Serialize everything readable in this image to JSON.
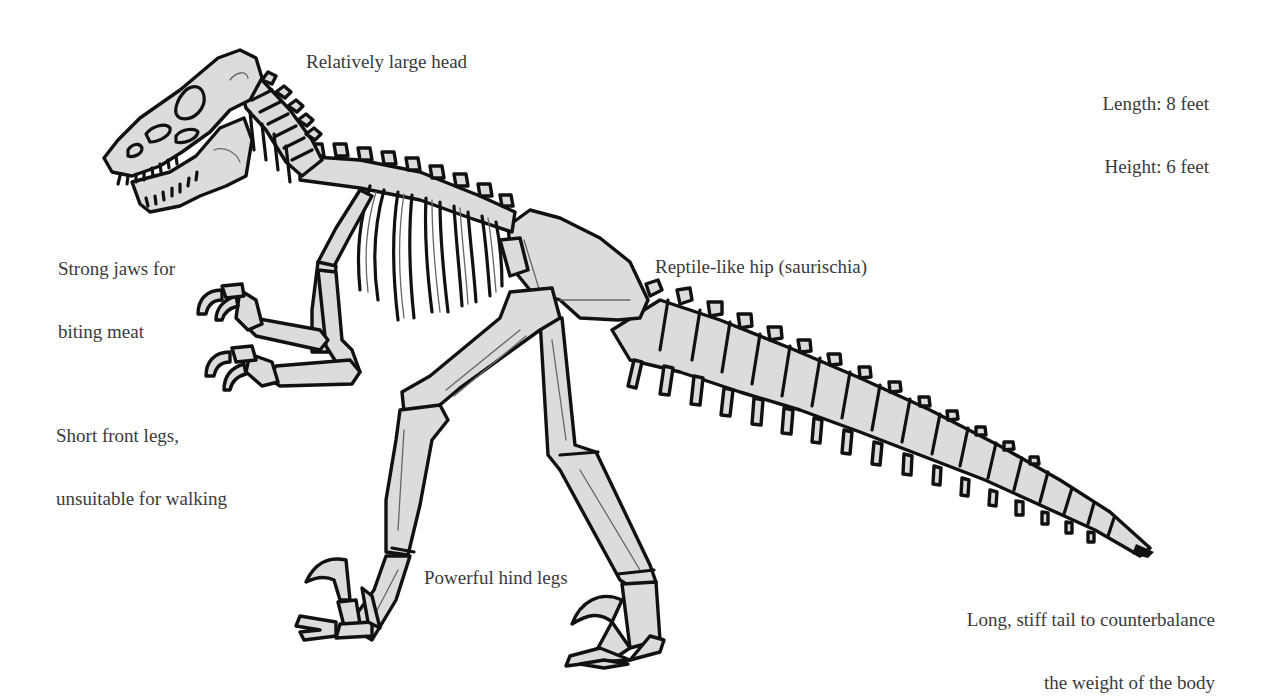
{
  "diagram": {
    "colors": {
      "background": "#ffffff",
      "bone_fill": "#dcdcdc",
      "outline": "#111111",
      "label_text": "#3a3a3a"
    },
    "dimensions": {
      "length": "Length: 8 feet",
      "height": "Height: 6 feet"
    },
    "labels": {
      "head": "Relatively large head",
      "jaws_line1": "Strong jaws for",
      "jaws_line2": "biting meat",
      "hip": "Reptile-like hip (saurischia)",
      "front_legs_line1": "Short front legs,",
      "front_legs_line2": "unsuitable for walking",
      "hind_legs": "Powerful hind legs",
      "tail_line1": "Long, stiff tail to counterbalance",
      "tail_line2": "the weight of the body"
    }
  }
}
